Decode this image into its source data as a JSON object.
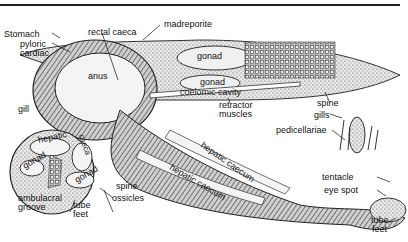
{
  "figure": {
    "labels": {
      "stomach": "Stomach",
      "pyloric": "pyloric",
      "cardiac": "cardiac",
      "rectal_caeca": "rectal caeca",
      "madreporite": "madreporite",
      "anus": "anus",
      "gonad_upper": "gonad",
      "gonad_middle": "gonad",
      "coelomic_cavity": "coelomic cavity",
      "retractor_muscles_1": "retractor",
      "retractor_muscles_2": "muscles",
      "gill_left": "gill",
      "spine_right": "spine",
      "gills_right": "gills",
      "pedicellariae": "pedicellariae",
      "hepatic_xs": "hepatic",
      "caeca_xs": "caeca",
      "gonad_xs_left": "gonad",
      "gonad_xs_right": "gonad",
      "spine_xs": "spine",
      "ossicles": "ossicles",
      "ambulacral_1": "ambulacral",
      "ambulacral_2": "groove",
      "tube_feet_xs_1": "tube",
      "tube_feet_xs_2": "feet",
      "hepatic_caecum_1": "hepatic caecum",
      "hepatic_caecum_2": "hepatic caecum",
      "tentacle": "tentacle",
      "eye_spot": "eye spot",
      "tube_feet_tip_1": "tube",
      "tube_feet_tip_2": "feet"
    }
  }
}
